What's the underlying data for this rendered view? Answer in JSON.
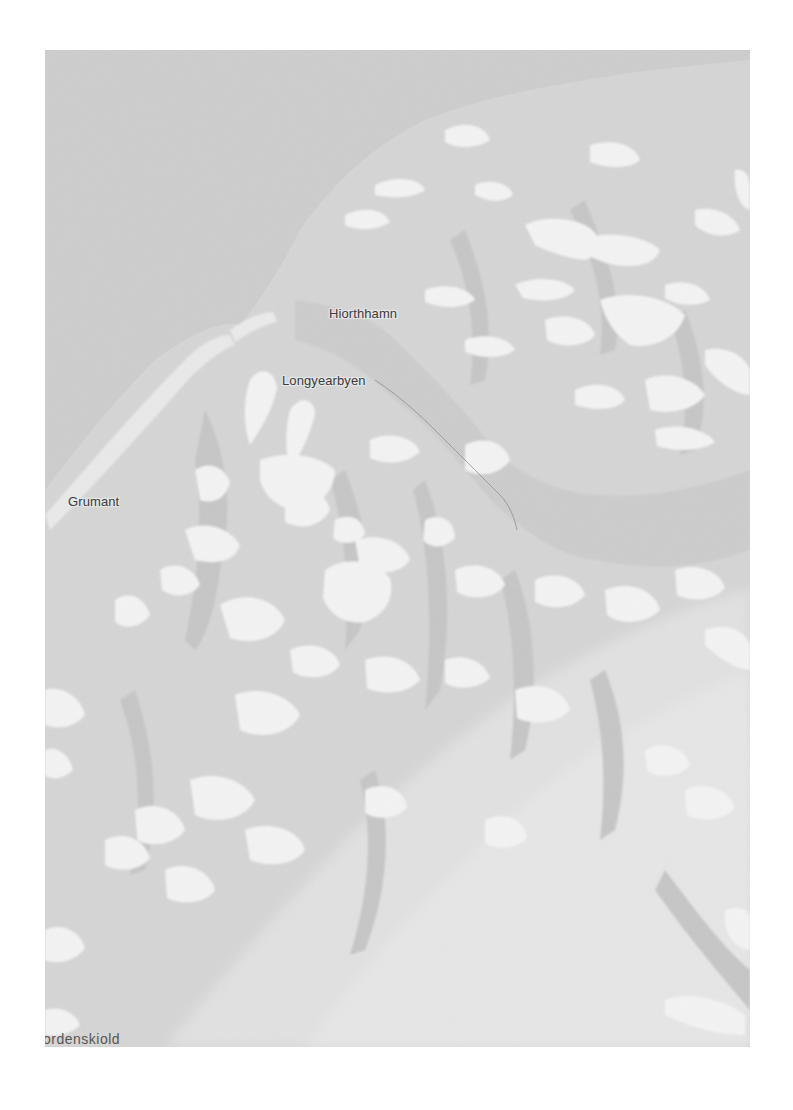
{
  "map": {
    "colors": {
      "water": "#cdcdcd",
      "land": "#d6d6d6",
      "land_shadow": "#c4c4c4",
      "valley_light": "#e3e3e3",
      "glacier": "#f4f4f4",
      "road": "#8f8f8f",
      "label": "#3a3a3a"
    },
    "labels": {
      "hiorthhamn": "Hiorthhamn",
      "longyearbyen": "Longyearbyen",
      "grumant": "Grumant",
      "nordenskiold": "ordenskiold"
    }
  }
}
